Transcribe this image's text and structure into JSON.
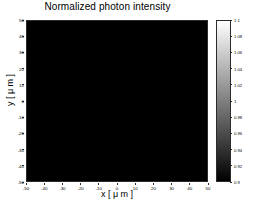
{
  "chart_data": {
    "type": "heatmap",
    "title": "Normalized photon intensity",
    "xlabel": "x [ μ m ]",
    "ylabel": "y [ μ m ]",
    "xlim": [
      -50,
      50
    ],
    "ylim": [
      -50,
      50
    ],
    "xticks": [
      -50,
      -40,
      -30,
      -20,
      -10,
      0,
      10,
      20,
      30,
      40,
      50
    ],
    "yticks": [
      50,
      40,
      30,
      20,
      10,
      0,
      -10,
      -20,
      -30,
      -40,
      -50
    ],
    "xticklabels": [
      "-50",
      "-40",
      "-30",
      "-20",
      "-10",
      "0",
      "10",
      "20",
      "30",
      "40",
      "50"
    ],
    "yticklabels": [
      "50",
      "40",
      "30",
      "20",
      "10",
      "0",
      "-10",
      "-20",
      "-30",
      "-40",
      "-50"
    ],
    "grid": false,
    "colormap": "gray",
    "colorbar": {
      "position": "right",
      "vmin": 0.9,
      "vmax": 1.1,
      "ticks": [
        1.1,
        1.08,
        1.06,
        1.04,
        1.02,
        1,
        0.98,
        0.96,
        0.94,
        0.92,
        0.9
      ],
      "ticklabels": [
        "1.1",
        "1.08",
        "1.06",
        "1.04",
        "1.02",
        "1",
        "0.98",
        "0.96",
        "0.94",
        "0.92",
        "0.9"
      ],
      "low_color": "#000000",
      "high_color": "#ffffff"
    },
    "background_value": 1.0,
    "pattern": {
      "description": "Fresnel-type concentric elliptical interference fringes with dark core and central bright spot",
      "center_x": 5,
      "center_y": 0,
      "core_bright_spot_x": 7,
      "core_bright_spot_y": 1,
      "ellipse_aspect": 1.35,
      "fringe_count": 9,
      "asymmetry": "fringes broaden toward -x, compress and fade toward +x",
      "amplitude_peak": 0.2,
      "decay_radius": 42,
      "noise_amplitude": 0.012
    }
  }
}
